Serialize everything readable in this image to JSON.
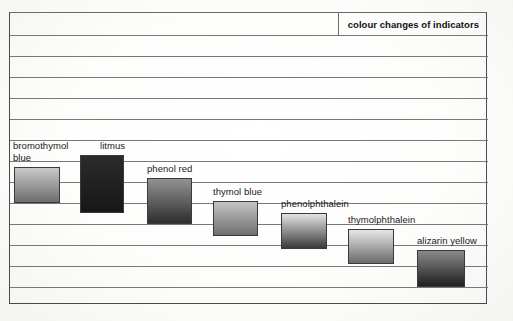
{
  "document": {
    "type": "scanned-diagram",
    "title": "colour changes of indicators"
  },
  "chart_data": {
    "type": "bar",
    "title": "colour changes of indicators",
    "xlabel": "",
    "ylabel": "",
    "grid": true,
    "legend_position": "none",
    "note": "Each swatch is a vertical colour-gradient bar spanning the pH range over which that indicator changes colour; bars form a descending staircase from left to right.",
    "categories": [
      "bromothymol blue",
      "litmus",
      "phenol red",
      "thymol blue",
      "phenolphthalein",
      "thymolphthalein",
      "alizarin yellow"
    ],
    "bars": [
      {
        "name": "bromothymol blue",
        "label": "bromothymol blue",
        "label_lines": [
          "bromothymol",
          "blue"
        ],
        "x": 13,
        "y": 166,
        "width": 46,
        "height": 36,
        "gradient_top": "#c9c9c9",
        "gradient_bottom": "#6d6d6d",
        "row_span": [
          7,
          8
        ],
        "label_x": 12,
        "label_y": 139
      },
      {
        "name": "litmus",
        "label": "litmus",
        "label_lines": [
          "litmus"
        ],
        "x": 79,
        "y": 154,
        "width": 44,
        "height": 58,
        "gradient_top": "#2b2b2b",
        "gradient_bottom": "#171717",
        "row_span": [
          6,
          9
        ],
        "label_x": 99,
        "label_y": 139
      },
      {
        "name": "phenol red",
        "label": "phenol red",
        "label_lines": [
          "phenol red"
        ],
        "x": 146,
        "y": 177,
        "width": 45,
        "height": 46,
        "gradient_top": "#929292",
        "gradient_bottom": "#2e2e2e",
        "row_span": [
          8,
          10
        ],
        "label_x": 146,
        "label_y": 162
      },
      {
        "name": "thymol blue",
        "label": "thymol blue",
        "label_lines": [
          "thymol blue"
        ],
        "x": 212,
        "y": 200,
        "width": 45,
        "height": 35,
        "gradient_top": "#c4c4c4",
        "gradient_bottom": "#6f6f6f",
        "row_span": [
          9,
          10
        ],
        "label_x": 212,
        "label_y": 185
      },
      {
        "name": "phenolphthalein",
        "label": "phenolphthalein",
        "label_lines": [
          "phenolphthalein"
        ],
        "x": 280,
        "y": 212,
        "width": 46,
        "height": 36,
        "gradient_top": "#e3e3e3",
        "gradient_bottom": "#3a3a3a",
        "row_span": [
          10,
          11
        ],
        "label_x": 280,
        "label_y": 197
      },
      {
        "name": "thymolphthalein",
        "label": "thymolphthalein",
        "label_lines": [
          "thymolphthalein"
        ],
        "x": 347,
        "y": 228,
        "width": 46,
        "height": 35,
        "gradient_top": "#e6e6e6",
        "gradient_bottom": "#6b6b6b",
        "row_span": [
          11,
          12
        ],
        "label_x": 347,
        "label_y": 213
      },
      {
        "name": "alizarin yellow",
        "label": "alizarin yellow",
        "label_lines": [
          "alizarin yellow"
        ],
        "x": 416,
        "y": 249,
        "width": 48,
        "height": 37,
        "gradient_top": "#8a8a8a",
        "gradient_bottom": "#1f1f1f",
        "row_span": [
          12,
          13
        ],
        "label_x": 416,
        "label_y": 234
      }
    ],
    "gridline_y": [
      23,
      44,
      65,
      86,
      107,
      128,
      149,
      170,
      191,
      212,
      233,
      254,
      275,
      292
    ],
    "frame": {
      "x": 9,
      "y": 12,
      "width": 478,
      "height": 292
    }
  },
  "colors": {
    "frame_stroke": "#4a4a4a",
    "gridline": "#787878",
    "text": "#1a1a1a",
    "paper": "#fdfdfc"
  }
}
